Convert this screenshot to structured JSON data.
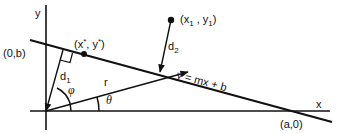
{
  "diagram": {
    "axes": {
      "x_label": "x",
      "y_label": "y"
    },
    "line": {
      "equation": "y = mx + b"
    },
    "points": {
      "y_intercept": "(0,b)",
      "x_intercept": "(a,0)",
      "foot_point": "(x*, y*)",
      "external_point": "(x1 , y1)"
    },
    "distances": {
      "d1": "d1",
      "d2": "d2",
      "r": "r"
    },
    "angles": {
      "phi": "φ",
      "theta": "θ"
    }
  }
}
